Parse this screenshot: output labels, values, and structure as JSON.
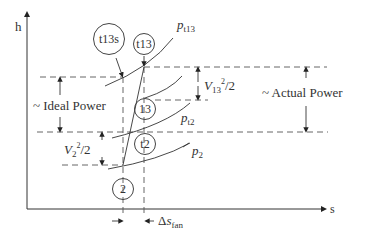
{
  "axes": {
    "y_label": "h",
    "x_label": "s"
  },
  "isobars": {
    "pt13": {
      "base": "p",
      "sub": "t13"
    },
    "pt2": {
      "base": "p",
      "sub": "t2"
    },
    "p2": {
      "base": "p",
      "sub": "2"
    }
  },
  "states": {
    "t13s": "t13s",
    "t13": "t13",
    "s13": "13",
    "t2": "t2",
    "s2": "2"
  },
  "annotations": {
    "ideal_power": "~ Ideal Power",
    "actual_power": "~ Actual Power",
    "v13": {
      "base": "V",
      "sub": "13",
      "sup": "2",
      "tail": "/2"
    },
    "v2": {
      "base": "V",
      "sub": "2",
      "sup": "2",
      "tail": "/2"
    },
    "delta_s_fan": {
      "prefix": "Δ",
      "base": "s",
      "sub": "fan"
    }
  },
  "colors": {
    "line": "#333333",
    "dash": "#555555"
  }
}
